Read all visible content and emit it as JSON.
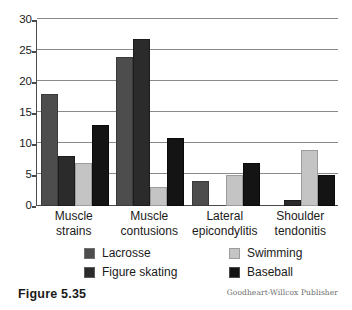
{
  "figure": {
    "caption": "Figure 5.35",
    "credit": "Goodheart-Willcox Publisher"
  },
  "chart_data": {
    "type": "bar",
    "title": "",
    "xlabel": "",
    "ylabel": "",
    "ylim": [
      0,
      30
    ],
    "yticks": [
      0,
      5,
      10,
      15,
      20,
      25,
      30
    ],
    "grid": true,
    "legend_position": "bottom",
    "categories": [
      "Muscle strains",
      "Muscle contusions",
      "Lateral epicondylitis",
      "Shoulder tendonitis"
    ],
    "category_lines": [
      [
        "Muscle",
        "strains"
      ],
      [
        "Muscle",
        "contusions"
      ],
      [
        "Lateral",
        "epicondylitis"
      ],
      [
        "Shoulder",
        "tendonitis"
      ]
    ],
    "series": [
      {
        "name": "Lacrosse",
        "color": "#4d4d4d",
        "values": [
          18,
          24,
          4,
          0
        ]
      },
      {
        "name": "Figure skating",
        "color": "#2b2b2b",
        "values": [
          8,
          27,
          0,
          1
        ]
      },
      {
        "name": "Swimming",
        "color": "#c4c4c4",
        "values": [
          7,
          3,
          5,
          9
        ]
      },
      {
        "name": "Baseball",
        "color": "#141414",
        "values": [
          13,
          11,
          7,
          5
        ]
      }
    ]
  },
  "legend": {
    "items": [
      {
        "label": "Lacrosse"
      },
      {
        "label": "Swimming"
      },
      {
        "label": "Figure skating"
      },
      {
        "label": "Baseball"
      }
    ]
  }
}
